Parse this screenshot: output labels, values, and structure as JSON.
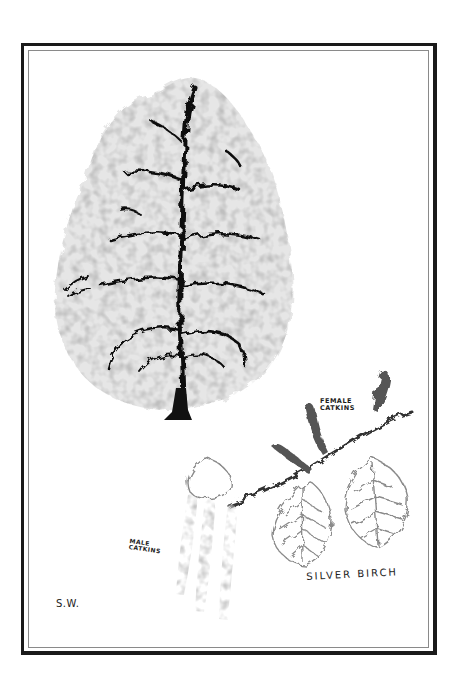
{
  "illustration": {
    "subject": "silver birch tree with catkins",
    "style": "monochrome pencil and ink drawing",
    "colors": {
      "background": "#ffffff",
      "frame_outer": "#1a1a1a",
      "frame_inner": "#8a8a8a",
      "ink": "#111111",
      "foliage": "#9a9a9a"
    }
  },
  "labels": {
    "female_catkins": "FEMALE\nCATKINS",
    "male_catkins": "MALE\nCATKINS",
    "title": "SILVER BIRCH",
    "signature": "S.W."
  }
}
